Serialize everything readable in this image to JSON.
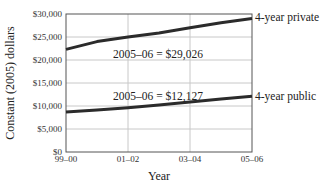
{
  "chart_data": {
    "type": "line",
    "title": "",
    "xlabel": "Year",
    "ylabel": "Constant (2005) dollars",
    "x": [
      "99–00",
      "00–01",
      "01–02",
      "02–03",
      "03–04",
      "04–05",
      "05–06"
    ],
    "x_tick_labels": [
      "99–00",
      "01–02",
      "03–04",
      "05–06"
    ],
    "y_tick_labels": [
      "$0",
      "$5,000",
      "$10,000",
      "$15,000",
      "$20,000",
      "$25,000",
      "$30,000"
    ],
    "ylim": [
      0,
      30000
    ],
    "grid": true,
    "legend": "direct labels at line ends",
    "series": [
      {
        "name": "4-year private",
        "values": [
          22300,
          24000,
          25000,
          25900,
          27000,
          28100,
          29026
        ],
        "annotation": "2005–06 = $29,026"
      },
      {
        "name": "4-year public",
        "values": [
          8700,
          9100,
          9600,
          10200,
          10900,
          11500,
          12127
        ],
        "annotation": "2005–06 = $12,127"
      }
    ],
    "colors": {
      "line": "#2b2b2b",
      "grid": "#c8c8c8",
      "frame": "#555555"
    }
  }
}
